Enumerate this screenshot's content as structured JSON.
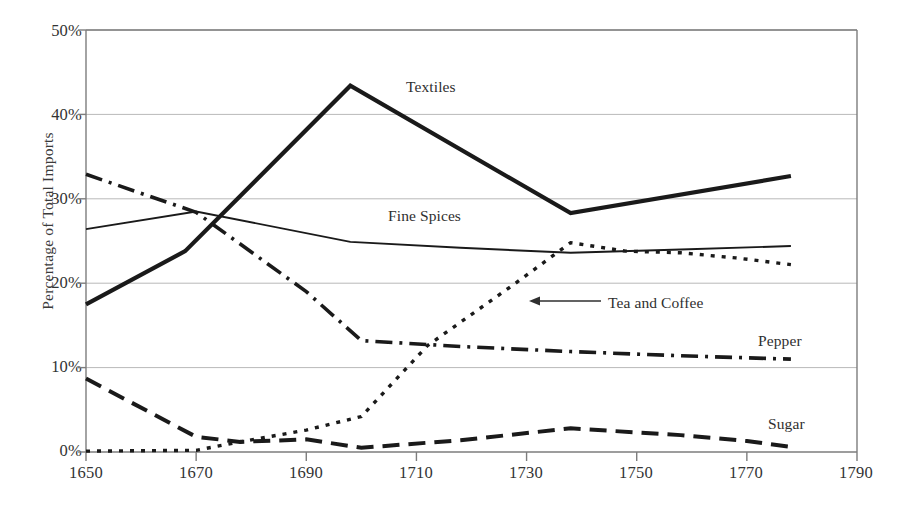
{
  "chart_data": {
    "type": "line",
    "title": "",
    "xlabel": "",
    "ylabel": "Percentage of Total Imports",
    "xlim": [
      1650,
      1790
    ],
    "ylim": [
      0,
      0.5
    ],
    "xticks": [
      "1650",
      "1670",
      "1690",
      "1710",
      "1730",
      "1750",
      "1770",
      "1790"
    ],
    "xtick_values": [
      1650,
      1670,
      1690,
      1710,
      1730,
      1750,
      1770,
      1790
    ],
    "yticks": [
      "0%",
      "10%",
      "20%",
      "30%",
      "40%",
      "50%"
    ],
    "ytick_values": [
      0,
      10,
      20,
      30,
      40,
      50
    ],
    "grid": "horizontal",
    "legend": "inline-annotations",
    "series": [
      {
        "name": "Textiles",
        "style": "solid-thick",
        "color": "#1a1a1a",
        "x": [
          1650,
          1668,
          1698,
          1738,
          1778
        ],
        "values": [
          17.5,
          23.8,
          43.4,
          28.3,
          32.7
        ]
      },
      {
        "name": "Fine Spices",
        "style": "solid-thin",
        "color": "#1a1a1a",
        "x": [
          1650,
          1670,
          1698,
          1718,
          1738,
          1758,
          1778
        ],
        "values": [
          26.4,
          28.5,
          24.9,
          24.2,
          23.6,
          24.0,
          24.4
        ]
      },
      {
        "name": "Pepper",
        "style": "dash-dot",
        "color": "#1a1a1a",
        "x": [
          1650,
          1670,
          1690,
          1700,
          1718,
          1738,
          1758,
          1778
        ],
        "values": [
          32.9,
          28.4,
          19.0,
          13.2,
          12.5,
          11.9,
          11.4,
          11.0
        ]
      },
      {
        "name": "Tea and Coffee",
        "style": "dotted",
        "color": "#1a1a1a",
        "x": [
          1650,
          1670,
          1678,
          1690,
          1700,
          1712,
          1728,
          1738,
          1748,
          1758,
          1768,
          1778
        ],
        "values": [
          0.1,
          0.2,
          1.2,
          2.6,
          4.2,
          12.6,
          20.0,
          24.8,
          23.8,
          23.6,
          23.0,
          22.2
        ]
      },
      {
        "name": "Sugar",
        "style": "long-dash",
        "color": "#1a1a1a",
        "x": [
          1650,
          1670,
          1678,
          1690,
          1700,
          1718,
          1738,
          1758,
          1770,
          1778
        ],
        "values": [
          8.7,
          1.8,
          1.2,
          1.5,
          0.5,
          1.4,
          2.8,
          2.0,
          1.3,
          0.6
        ]
      }
    ],
    "annotations": [
      {
        "name": "Textiles",
        "text": "Textiles",
        "x": 406,
        "y": 78
      },
      {
        "name": "Fine Spices",
        "text": "Fine Spices",
        "x": 388,
        "y": 207
      },
      {
        "name": "Tea and Coffee",
        "text": "Tea and Coffee",
        "x": 608,
        "y": 294,
        "arrow": "left"
      },
      {
        "name": "Pepper",
        "text": "Pepper",
        "x": 758,
        "y": 332
      },
      {
        "name": "Sugar",
        "text": "Sugar",
        "x": 768,
        "y": 415
      }
    ]
  },
  "axis": {
    "ylabel": "Percentage of Total Imports",
    "ytick_0": "0%",
    "ytick_1": "10%",
    "ytick_2": "20%",
    "ytick_3": "30%",
    "ytick_4": "40%",
    "ytick_5": "50%",
    "xtick_0": "1650",
    "xtick_1": "1670",
    "xtick_2": "1690",
    "xtick_3": "1710",
    "xtick_4": "1730",
    "xtick_5": "1750",
    "xtick_6": "1770",
    "xtick_7": "1790"
  },
  "labels": {
    "textiles": "Textiles",
    "fine_spices": "Fine Spices",
    "tea_and_coffee": "Tea and Coffee",
    "pepper": "Pepper",
    "sugar": "Sugar"
  },
  "caption": {
    "text": ""
  }
}
